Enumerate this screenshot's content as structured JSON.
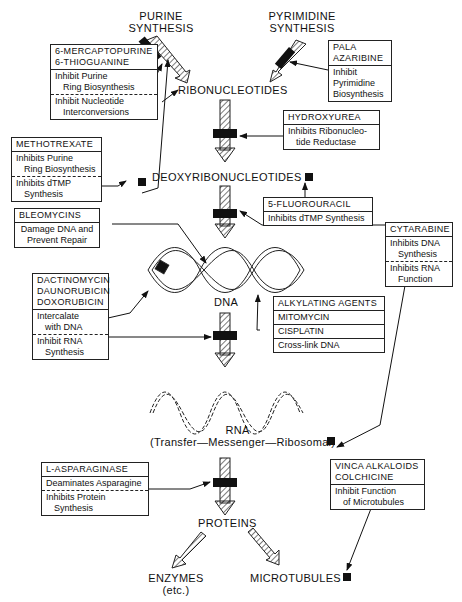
{
  "nodes": {
    "purine": "PURINE SYNTHESIS",
    "purine_l1": "PURINE",
    "purine_l2": "SYNTHESIS",
    "pyrimidine_l1": "PYRIMIDINE",
    "pyrimidine_l2": "SYNTHESIS",
    "ribonucleotides": "RIBONUCLEOTIDES",
    "deoxyribonucleotides": "DEOXYRIBONUCLEOTIDES",
    "dna": "DNA",
    "rna": "RNA",
    "rna_types": "(Transfer—Messenger—Ribosomal)",
    "proteins": "PROTEINS",
    "enzymes_l1": "ENZYMES",
    "enzymes_l2": "(etc.)",
    "microtubules": "MICROTUBULES"
  },
  "boxes": {
    "mercaptopurine": {
      "title_l1": "6-MERCAPTOPURINE",
      "title_l2": "6-THIOGUANINE",
      "a_l1": "Inhibit Purine",
      "a_l2": "Ring Biosynthesis",
      "b_l1": "Inhibit Nucleotide",
      "b_l2": "Interconversions"
    },
    "pala": {
      "title_l1": "PALA",
      "title_l2": "AZARIBINE",
      "a_l1": "Inhibit",
      "a_l2": "Pyrimidine",
      "a_l3": "Biosynthesis"
    },
    "hydroxyurea": {
      "title": "HYDROXYUREA",
      "a_l1": "Inhibits Ribonucleo-",
      "a_l2": "tide Reductase"
    },
    "methotrexate": {
      "title": "METHOTREXATE",
      "a_l1": "Inhibits Purine",
      "a_l2": "Ring Biosynthesis",
      "b_l1": "Inhibits dTMP",
      "b_l2": "Synthesis"
    },
    "fluorouracil": {
      "title": "5-FLUOROURACIL",
      "a_l1": "Inhibits dTMP Synthesis"
    },
    "bleomycins": {
      "title": "BLEOMYCINS",
      "a_l1": "Damage DNA and",
      "a_l2": "Prevent Repair"
    },
    "cytarabine": {
      "title": "CYTARABINE",
      "a_l1": "Inhibits DNA",
      "a_l2": "Synthesis",
      "b_l1": "Inhibits RNA",
      "b_l2": "Function"
    },
    "dactinomycin": {
      "title_l1": "DACTINOMYCIN",
      "title_l2": "DAUNORUBICIN",
      "title_l3": "DOXORUBICIN",
      "a_l1": "Intercalate",
      "a_l2": "with DNA",
      "b_l1": "Inhibit RNA",
      "b_l2": "Synthesis"
    },
    "alkylating": {
      "title": "ALKYLATING AGENTS",
      "r1": "MITOMYCIN",
      "r2": "CISPLATIN",
      "r3": "Cross-link DNA"
    },
    "asparaginase": {
      "title": "L-ASPARAGINASE",
      "a_l1": "Deaminates Asparagine",
      "b_l1": "Inhibits Protein",
      "b_l2": "Synthesis"
    },
    "vinca": {
      "title_l1": "VINCA ALKALOIDS",
      "title_l2": "COLCHICINE",
      "a_l1": "Inhibit Function",
      "a_l2": "of Microtubules"
    }
  }
}
